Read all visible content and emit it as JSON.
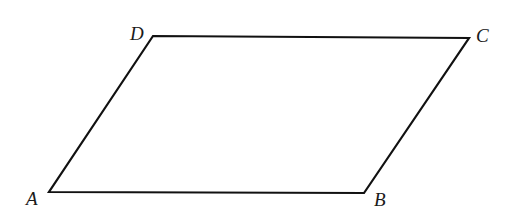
{
  "diagram": {
    "type": "parallelogram",
    "shape_name": "ABCD",
    "stroke_color": "#111111",
    "vertices": [
      {
        "name": "A",
        "label": "A",
        "x": 49,
        "y": 192,
        "label_x": 26,
        "label_y": 205
      },
      {
        "name": "B",
        "label": "B",
        "x": 364,
        "y": 193,
        "label_x": 374,
        "label_y": 206
      },
      {
        "name": "C",
        "label": "C",
        "x": 469,
        "y": 38,
        "label_x": 476,
        "label_y": 42
      },
      {
        "name": "D",
        "label": "D",
        "x": 153,
        "y": 36,
        "label_x": 130,
        "label_y": 40
      }
    ],
    "edges": [
      {
        "from": "A",
        "to": "B"
      },
      {
        "from": "B",
        "to": "C"
      },
      {
        "from": "C",
        "to": "D"
      },
      {
        "from": "D",
        "to": "A"
      }
    ]
  }
}
